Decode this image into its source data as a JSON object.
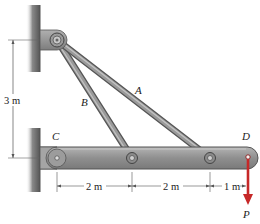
{
  "figure": {
    "labels": {
      "A": "A",
      "B": "B",
      "C": "C",
      "D": "D",
      "P": "P"
    },
    "dimensions": {
      "vertical": "3 m",
      "segment_CB": "2 m",
      "segment_BA": "2 m",
      "segment_AD": "1 m"
    },
    "colors": {
      "beam": "#8e8e8e",
      "beam_edge": "#5c5c5c",
      "rod": "#7a7a7a",
      "wall": "#6a6a6a",
      "load_arrow": "#c62828",
      "dimension_line": "#444444"
    }
  }
}
